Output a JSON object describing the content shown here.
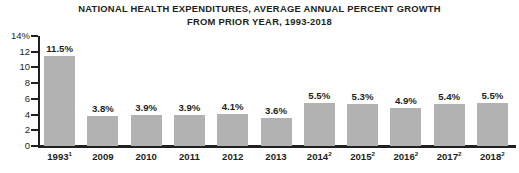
{
  "chart_data": {
    "type": "bar",
    "title": "NATIONAL HEALTH EXPENDITURES, AVERAGE ANNUAL PERCENT GROWTH FROM PRIOR YEAR, 1993-2018",
    "title_line1": "NATIONAL HEALTH EXPENDITURES, AVERAGE ANNUAL PERCENT GROWTH",
    "title_line2": "FROM PRIOR YEAR, 1993-2018",
    "xlabel": "",
    "ylabel": "",
    "ylim": [
      0,
      14
    ],
    "grid": false,
    "legend": "none",
    "y_ticks": [
      0,
      2,
      4,
      6,
      8,
      10,
      12,
      14
    ],
    "y_tick_labels": [
      "0",
      "2",
      "4",
      "6",
      "8",
      "10",
      "12",
      "14%"
    ],
    "bar_color": "#b2b2b2",
    "axis_color": "#231f20",
    "categories": [
      "1993",
      "2009",
      "2010",
      "2011",
      "2012",
      "2013",
      "2014",
      "2015",
      "2016",
      "2017",
      "2018"
    ],
    "category_footnotes": [
      "1",
      "",
      "",
      "",
      "",
      "",
      "2",
      "2",
      "2",
      "2",
      "2"
    ],
    "values": [
      11.5,
      3.8,
      3.9,
      3.9,
      4.1,
      3.6,
      5.5,
      5.3,
      4.9,
      5.4,
      5.5
    ],
    "value_labels": [
      "11.5%",
      "3.8%",
      "3.9%",
      "3.9%",
      "4.1%",
      "3.6%",
      "5.5%",
      "5.3%",
      "4.9%",
      "5.4%",
      "5.5%"
    ]
  }
}
